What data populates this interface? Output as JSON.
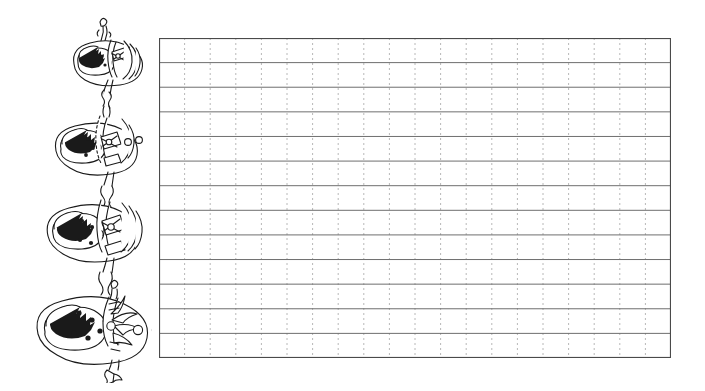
{
  "page": {
    "title": "Handwriting Practice Worksheet",
    "background_color": "#ffffff",
    "width": 705,
    "height": 391
  },
  "illustration": {
    "name": "stacked-wrapped-eggs-illustration",
    "description": "Hand-drawn black line art of four nested egg-shaped wrapped candy dolls stacked vertically, increasing in size from top to bottom, joined by twisted wrapper ties.",
    "style": "black-and-white line drawing, uncolored, for coloring",
    "stroke_color": "#1a1a1a",
    "fill_color": "#ffffff",
    "figure_count": 4,
    "figures": [
      {
        "index": 1,
        "name": "wrapped-egg-small",
        "size_label": "smallest",
        "face_dots": 2,
        "has_striped_shell": true,
        "has_twist_top": true,
        "button_dots": 0
      },
      {
        "index": 2,
        "name": "wrapped-egg-medium",
        "size_label": "small-medium",
        "face_dots": 3,
        "has_striped_shell": true,
        "has_twist_top": true,
        "button_dots": 2
      },
      {
        "index": 3,
        "name": "wrapped-egg-large",
        "size_label": "medium-large",
        "face_dots": 4,
        "has_striped_shell": true,
        "has_twist_top": true,
        "button_dots": 0
      },
      {
        "index": 4,
        "name": "wrapped-egg-largest",
        "size_label": "largest",
        "face_dots": 5,
        "has_striped_shell": false,
        "has_twist_top": true,
        "button_dots": 2
      }
    ]
  },
  "writing_grid": {
    "name": "handwriting-practice-grid",
    "rows": 13,
    "columns": 20,
    "row_height_px": 24.6,
    "column_width_px": 25.6,
    "width_px": 512,
    "height_px": 320,
    "horizontal_line_style": "solid",
    "horizontal_line_color": "#6e6e6e",
    "vertical_line_style": "dotted",
    "vertical_line_color": "#b8b8b8",
    "border_color": "#4a4a4a",
    "border_width_px": 1,
    "cell_content": ""
  }
}
